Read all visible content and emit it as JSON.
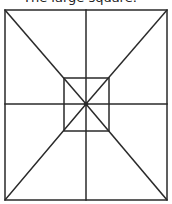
{
  "heading": {
    "number_label": "",
    "text": "The large square."
  },
  "diagram": {
    "stroke_color": "#2a2a2a",
    "outer_square": {
      "x1": 5,
      "y1": 10,
      "x2": 167,
      "y2": 200
    },
    "inner_square": {
      "x1": 64,
      "y1": 78,
      "x2": 109,
      "y2": 131
    },
    "center": {
      "x": 86,
      "y": 104
    },
    "lines": [
      {
        "name": "diagonal-top-left",
        "x1": 5,
        "y1": 10,
        "x2": 86,
        "y2": 104
      },
      {
        "name": "diagonal-top-right",
        "x1": 167,
        "y1": 10,
        "x2": 86,
        "y2": 104
      },
      {
        "name": "diagonal-bottom-left",
        "x1": 5,
        "y1": 200,
        "x2": 86,
        "y2": 104
      },
      {
        "name": "diagonal-bottom-right",
        "x1": 167,
        "y1": 200,
        "x2": 86,
        "y2": 104
      },
      {
        "name": "vertical-midline",
        "x1": 86,
        "y1": 10,
        "x2": 86,
        "y2": 200
      },
      {
        "name": "horizontal-midline",
        "x1": 5,
        "y1": 104,
        "x2": 167,
        "y2": 104
      }
    ]
  }
}
